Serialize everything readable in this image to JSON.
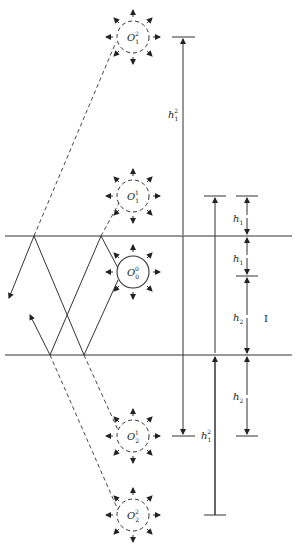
{
  "diagram": {
    "layer_label": "I",
    "sources": [
      {
        "id": "O1_2",
        "label": "O",
        "sub": "1",
        "sup": "2",
        "cx": 133,
        "cy": 37,
        "style": "dashed"
      },
      {
        "id": "O1_1",
        "label": "O",
        "sub": "1",
        "sup": "1",
        "cx": 133,
        "cy": 196,
        "style": "dashed"
      },
      {
        "id": "O0_0",
        "label": "O",
        "sub": "0",
        "sup": "0",
        "cx": 133,
        "cy": 272,
        "style": "solid"
      },
      {
        "id": "O2_1",
        "label": "O",
        "sub": "2",
        "sup": "1",
        "cx": 133,
        "cy": 436,
        "style": "dashed"
      },
      {
        "id": "O2_2",
        "label": "O",
        "sub": "2",
        "sup": "2",
        "cx": 133,
        "cy": 515,
        "style": "dashed"
      }
    ],
    "planes": {
      "top_y": 236,
      "bottom_y": 355
    },
    "dimensions": [
      {
        "label": "h",
        "sub": "1",
        "sup": "2",
        "x": 172,
        "y": 115
      },
      {
        "label": "h",
        "sub": "1",
        "sup": "",
        "x": 232,
        "y": 220
      },
      {
        "label": "h",
        "sub": "1",
        "sup": "",
        "x": 232,
        "y": 259
      },
      {
        "label": "h",
        "sub": "2",
        "sup": "",
        "x": 232,
        "y": 319
      },
      {
        "label": "h",
        "sub": "2",
        "sup": "",
        "x": 232,
        "y": 397
      },
      {
        "label": "h",
        "sub": "1",
        "sup": "2",
        "x": 200,
        "y": 436
      }
    ],
    "colors": {
      "line": "#333333",
      "background": "#ffffff"
    }
  }
}
